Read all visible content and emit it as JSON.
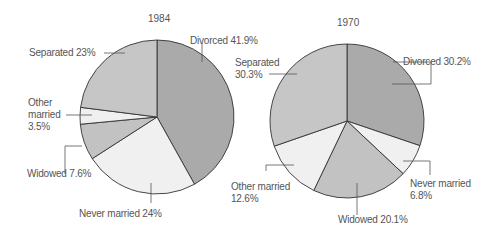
{
  "chart_data": [
    {
      "type": "pie",
      "title": "1984",
      "start_angle": "12 o'clock, clockwise",
      "slices": [
        {
          "label": "Divorced",
          "value": 41.9,
          "color": "#aaaaaa"
        },
        {
          "label": "Never married",
          "value": 24,
          "color": "#f0f0f0"
        },
        {
          "label": "Widowed",
          "value": 7.6,
          "color": "#c2c2c2"
        },
        {
          "label": "Other married",
          "value": 3.5,
          "color": "#f0f0f0"
        },
        {
          "label": "Separated",
          "value": 23,
          "color": "#c6c6c6"
        }
      ]
    },
    {
      "type": "pie",
      "title": "1970",
      "start_angle": "12 o'clock, clockwise",
      "slices": [
        {
          "label": "Divorced",
          "value": 30.2,
          "color": "#aaaaaa"
        },
        {
          "label": "Never married",
          "value": 6.8,
          "color": "#f0f0f0"
        },
        {
          "label": "Widowed",
          "value": 20.1,
          "color": "#c2c2c2"
        },
        {
          "label": "Other married",
          "value": 12.6,
          "color": "#f0f0f0"
        },
        {
          "label": "Separated",
          "value": 30.3,
          "color": "#c6c6c6"
        }
      ]
    }
  ],
  "labels": {
    "p1984": {
      "title": "1984",
      "divorced": "Divorced 41.9%",
      "separated": "Separated 23%",
      "other_married_1": "Other",
      "other_married_2": "married",
      "other_married_3": "3.5%",
      "widowed": "Widowed 7.6%",
      "never_married": "Never married 24%"
    },
    "p1970": {
      "title": "1970",
      "separated_1": "Separated",
      "separated_2": "30.3%",
      "divorced": "Divorced 30.2%",
      "other_married_1": "Other married",
      "other_married_2": "12.6%",
      "never_married_1": "Never married",
      "never_married_2": "6.8%",
      "widowed": "Widowed 20.1%"
    }
  }
}
